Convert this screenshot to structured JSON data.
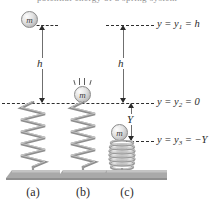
{
  "figure": {
    "clipped_header_text": "potential energy of a spring system",
    "labels": {
      "y1": "y = y",
      "y1_sub": "1",
      "y1_tail": " = h",
      "y2": "y = y",
      "y2_sub": "2",
      "y2_tail": " = 0",
      "y3": "y = y",
      "y3_sub": "3",
      "y3_tail": " = −Y"
    },
    "measurements": {
      "h_left": "h",
      "h_right": "h",
      "Y": "Y"
    },
    "mass_label": "m",
    "panels": [
      {
        "caption": "(a)",
        "mass_label": "m",
        "spring_state": "relaxed",
        "mass_position": "dropped-from-height-h"
      },
      {
        "caption": "(b)",
        "mass_label": "m",
        "spring_state": "relaxed",
        "mass_position": "at-y2-contact"
      },
      {
        "caption": "(c)",
        "mass_label": "m",
        "spring_state": "compressed",
        "mass_position": "at-y3-minus-Y"
      }
    ],
    "colors": {
      "spring": "#8e8e8e",
      "ground": "#a8a8a8",
      "dash": "#2f2f2f",
      "text": "#2b2b2b",
      "mass_fill": "#d9d9d9"
    }
  }
}
